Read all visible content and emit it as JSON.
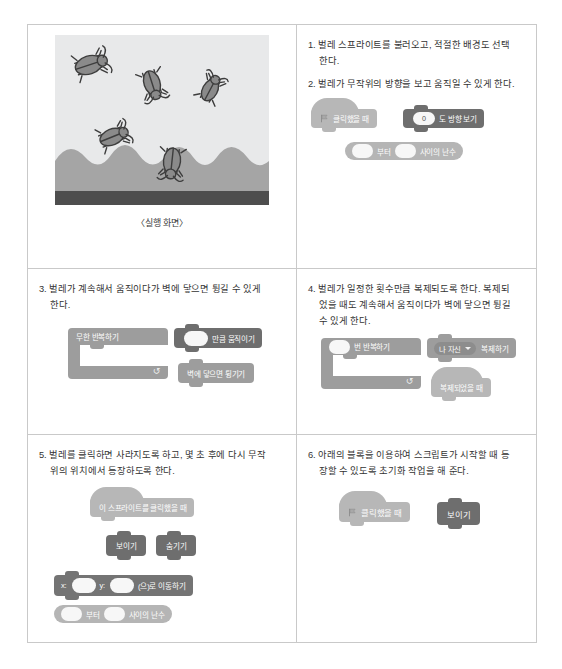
{
  "figure": {
    "stage_caption": "〈실행 화면〉",
    "stage_alt": "bugs-on-grass-stage"
  },
  "steps": [
    {
      "id": "step-1",
      "lines": [
        "1. 벌레 스프라이트를 불러오고, 적절한 배경도 선택",
        "한다."
      ]
    },
    {
      "id": "step-2",
      "lines": [
        "2. 벌레가 무작위의 방향을 보고 움직일 수 있게 한다."
      ]
    },
    {
      "id": "step-3",
      "lines": [
        "3. 벌레가 계속해서 움직이다가 벽에 닿으면 튕길 수 있게",
        "한다."
      ]
    },
    {
      "id": "step-4",
      "lines": [
        "4. 벌레가 일정한 횟수만큼 복제되도록 한다. 복제되",
        "었을 때도 계속해서 움직이다가 벽에 닿으면 튕길",
        "수 있게 한다."
      ]
    },
    {
      "id": "step-5",
      "lines": [
        "5. 벌레를 클릭하면 사라지도록 하고, 몇 초 후에 다시 무작",
        "위의 위치에서 등장하도록 한다."
      ]
    },
    {
      "id": "step-6",
      "lines": [
        "6. 아래의 블록을 이용하여 스크립트가 시작할 때 등",
        "장할 수 있도록 초기화 작업을 해 준다."
      ]
    }
  ],
  "blocks": {
    "when_flag_clicked": "클릭했을 때",
    "point_in_direction_value": "0",
    "point_in_direction_label": "도 방향 보기",
    "pick_random_from": "부터",
    "pick_random_to": "사이의 난수",
    "forever": "무한 반복하기",
    "move_steps": "만큼 움직이기",
    "if_on_edge_bounce": "벽에 닿으면 튕기기",
    "repeat_label": "번 반복하기",
    "create_clone_target": "나 자신",
    "create_clone_label": "복제하기",
    "when_i_start_as_clone": "복제되었을 때",
    "when_sprite_clicked": "이 스프라이트를 클릭했을 때",
    "show": "보이기",
    "hide": "숨기기",
    "goto_x": "x:",
    "goto_y": "y:",
    "goto_label": "(으)로 이동하기",
    "flag_icon": "green-flag-icon"
  },
  "colors": {
    "block_light": "#b7b7b7",
    "block_mid": "#9d9d9d",
    "block_dark": "#6e6e6e",
    "table_border": "#c9c9c9",
    "stage_sky": "#e8e9ea",
    "stage_hill": "#a5a5a5",
    "stage_ground": "#4e4e4e"
  }
}
